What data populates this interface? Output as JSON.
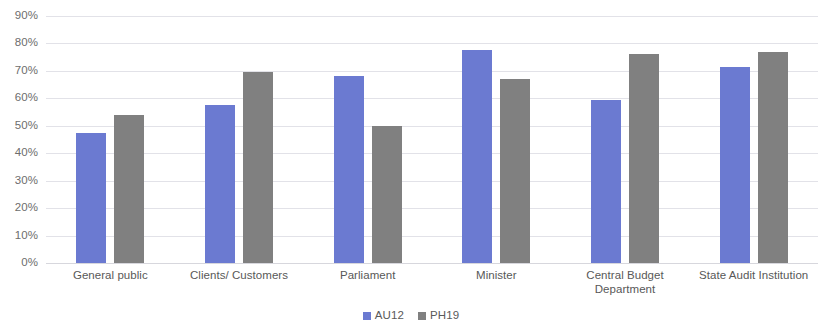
{
  "chart_data": {
    "type": "bar",
    "title": "",
    "subtitle": "",
    "xlabel": "",
    "ylabel": "",
    "ylim": [
      0,
      90
    ],
    "ytick_step": 10,
    "ytick_labels": [
      "90%",
      "80%",
      "70%",
      "60%",
      "50%",
      "40%",
      "30%",
      "20%",
      "10%",
      "0%"
    ],
    "ytick_values": [
      90,
      80,
      70,
      60,
      50,
      40,
      30,
      20,
      10,
      0
    ],
    "grid": true,
    "grid_axis": "y",
    "legend_position": "bottom",
    "categories": [
      "General public",
      "Clients/ Customers",
      "Parliament",
      "Minister",
      "Central Budget Department",
      "State Audit Institution"
    ],
    "series": [
      {
        "name": "AU12",
        "color": "#6B7AD1",
        "values": [
          47.5,
          57.5,
          68,
          77.5,
          59.5,
          71.5
        ]
      },
      {
        "name": "PH19",
        "color": "#808080",
        "values": [
          54,
          69.5,
          50,
          67,
          76,
          77
        ]
      }
    ]
  },
  "legend": {
    "items": [
      {
        "label": "AU12",
        "color": "#6B7AD1"
      },
      {
        "label": "PH19",
        "color": "#808080"
      }
    ]
  },
  "colors": {
    "series_au12": "#6B7AD1",
    "series_ph19": "#808080",
    "gridline": "#e2e2e8",
    "tick_text": "#6d6d6d",
    "category_text": "#585858",
    "background": "#ffffff"
  }
}
